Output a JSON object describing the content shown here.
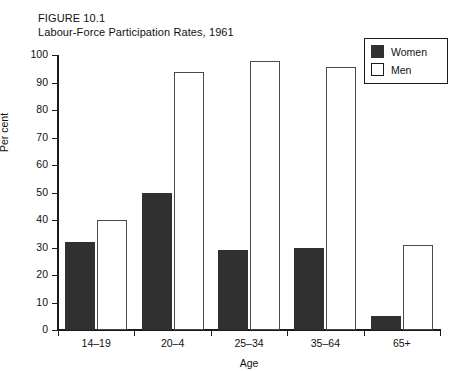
{
  "figure": {
    "number_line": "FIGURE 10.1",
    "title_line": "Labour-Force Participation Rates, 1961"
  },
  "legend": {
    "position": "top-right",
    "entries": [
      {
        "label": "Women",
        "swatch": "filled-dark-square",
        "color": "#303030"
      },
      {
        "label": "Men",
        "swatch": "open-white-square",
        "color": "#ffffff"
      }
    ]
  },
  "chart_data": {
    "type": "bar",
    "title": "Labour-Force Participation Rates, 1961",
    "subtitle": "FIGURE 10.1",
    "xlabel": "Age",
    "ylabel": "Per cent",
    "ylim": [
      0,
      100
    ],
    "ytick_step": 10,
    "yticks": [
      "100",
      "90",
      "80",
      "70",
      "60",
      "50",
      "40",
      "30",
      "20",
      "10",
      "0"
    ],
    "grid": false,
    "legend_position": "top-right",
    "categories": [
      "14–19",
      "20–4",
      "25–34",
      "35–64",
      "65+"
    ],
    "series": [
      {
        "name": "Women",
        "color": "#303030",
        "values": [
          32,
          50,
          29,
          30,
          5
        ]
      },
      {
        "name": "Men",
        "color": "#ffffff",
        "values": [
          40,
          94,
          98,
          95.5,
          31
        ]
      }
    ]
  }
}
